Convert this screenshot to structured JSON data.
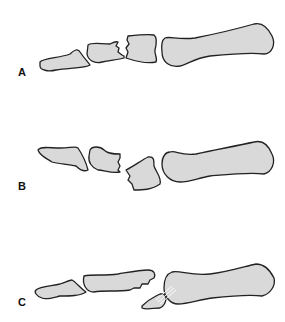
{
  "figure": {
    "panels": [
      {
        "id": "A",
        "label": "A",
        "caption": "Comminuted fracture of proximal phalanx base"
      },
      {
        "id": "B",
        "label": "B",
        "caption": "Fracture with displaced fragment at base of proximal phalanx"
      },
      {
        "id": "C",
        "label": "C",
        "caption": "Avulsion fracture with ligament attached to fragment"
      }
    ],
    "colors": {
      "bone_fill": "#d9d9d9",
      "outline": "#222222",
      "background": "#ffffff"
    }
  }
}
